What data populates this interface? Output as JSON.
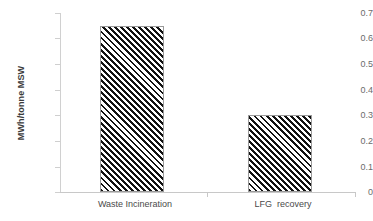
{
  "chart_data": {
    "type": "bar",
    "title": "",
    "xlabel": "",
    "ylabel": "MWh/tonne MSW",
    "categories": [
      "Waste Incineration",
      "LFG  recovery"
    ],
    "values": [
      0.65,
      0.3
    ],
    "ylim": [
      0,
      0.7
    ],
    "ytick_labels": [
      "0.7",
      "0.6",
      "0.5",
      "0.4",
      "0.3",
      "0.2",
      "0.1",
      "0"
    ],
    "ytick_values": [
      0.7,
      0.6,
      0.5,
      0.4,
      0.3,
      0.2,
      0.1,
      0
    ],
    "grid": false,
    "legend": null,
    "bar_fill": "diagonal-hatch",
    "bar_colors": [
      "#111111",
      "#111111"
    ],
    "background": "#ffffff",
    "axis_color": "#c8c8c8",
    "text_color": "#4a4a4a"
  }
}
